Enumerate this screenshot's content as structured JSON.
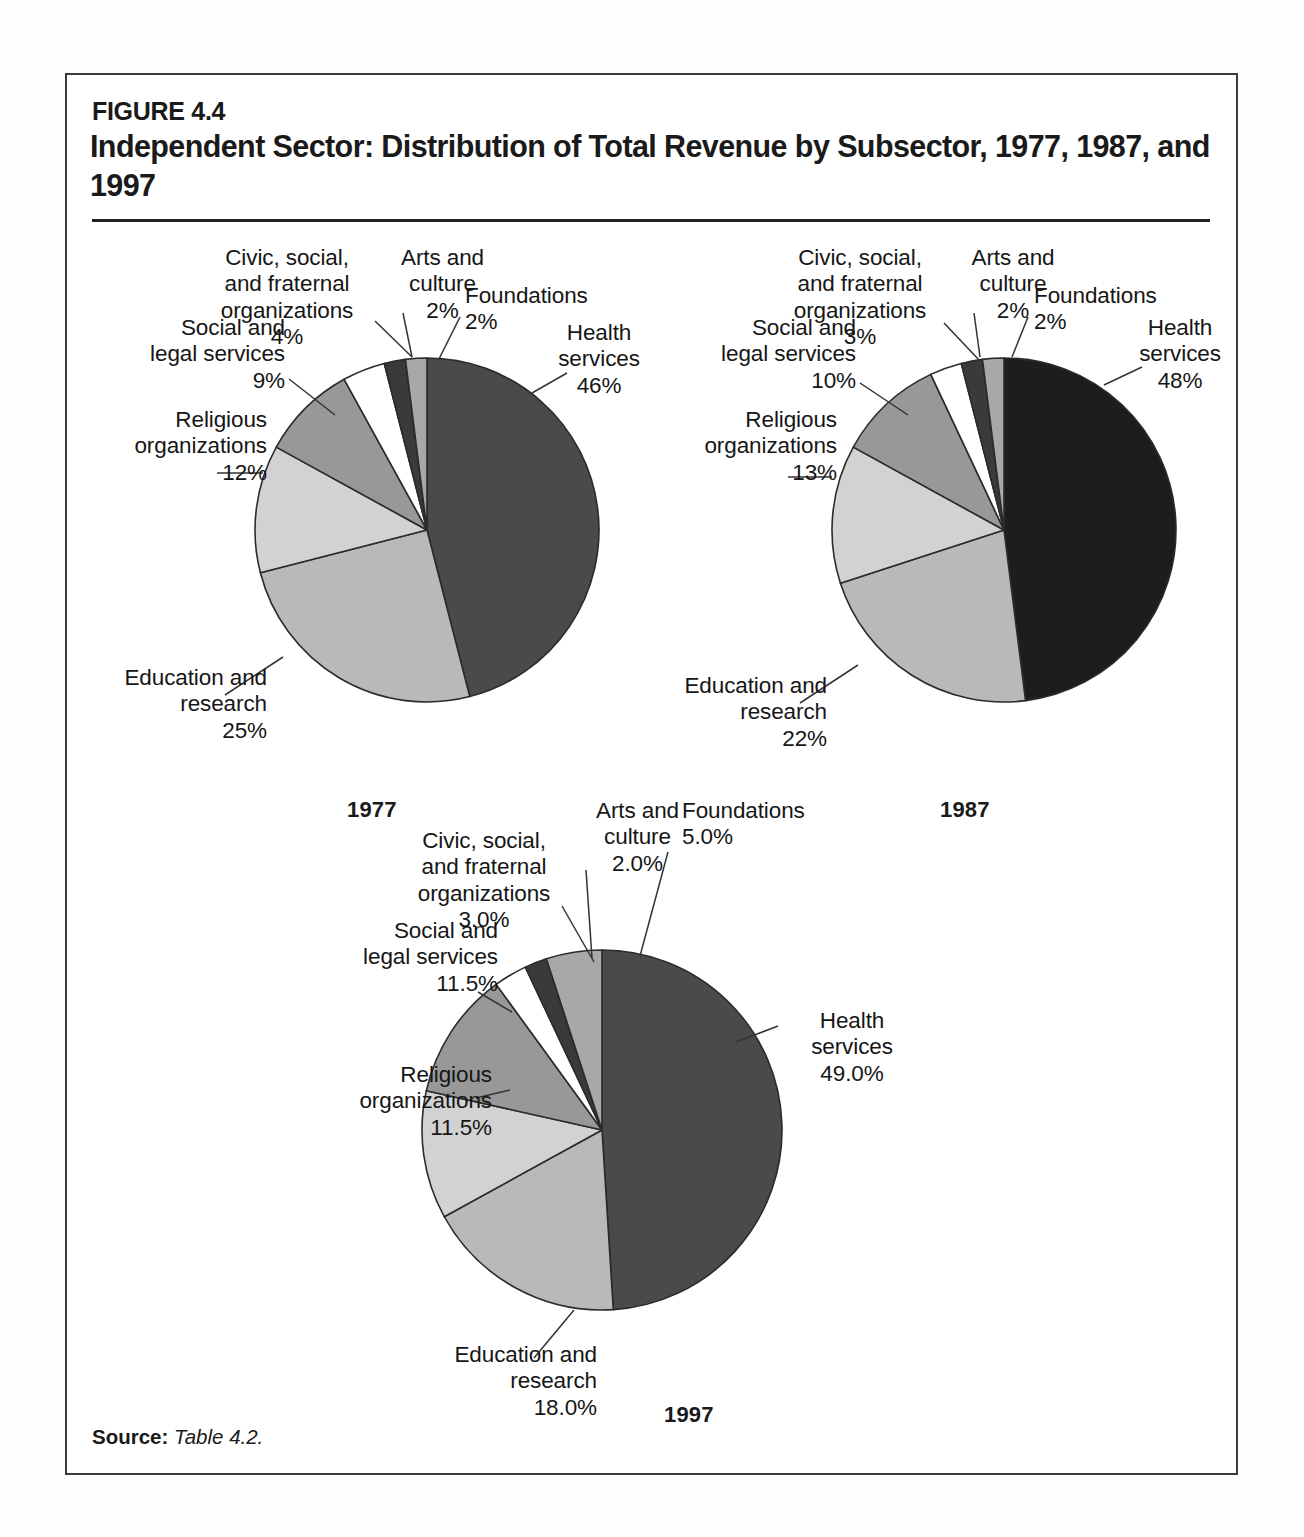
{
  "figure": {
    "number": "FIGURE 4.4",
    "title": "Independent Sector: Distribution of Total Revenue by Subsector,\n1977, 1987, and 1997",
    "source_label": "Source:",
    "source_value": "Table 4.2."
  },
  "chart_data": [
    {
      "type": "pie",
      "title": "1977",
      "categories": [
        "Health services",
        "Education and research",
        "Religious organizations",
        "Social and legal services",
        "Civic, social, and fraternal organizations",
        "Arts and culture",
        "Foundations"
      ],
      "values": [
        46,
        25,
        12,
        9,
        4,
        2,
        2
      ],
      "value_labels": [
        "46%",
        "25%",
        "12%",
        "9%",
        "4%",
        "2%",
        "2%"
      ],
      "colors": [
        "#4a4a4a",
        "#b9b9b9",
        "#d2d2d2",
        "#989898",
        "#ffffff",
        "#3a3a3a",
        "#a8a8a8"
      ],
      "start_angle": 0,
      "direction": "clockwise",
      "legend": "none"
    },
    {
      "type": "pie",
      "title": "1987",
      "categories": [
        "Health services",
        "Education and research",
        "Religious organizations",
        "Social and legal services",
        "Civic, social, and fraternal organizations",
        "Arts and culture",
        "Foundations"
      ],
      "values": [
        48,
        22,
        13,
        10,
        3,
        2,
        2
      ],
      "value_labels": [
        "48%",
        "22%",
        "13%",
        "10%",
        "3%",
        "2%",
        "2%"
      ],
      "colors": [
        "#1d1d1d",
        "#b9b9b9",
        "#d2d2d2",
        "#989898",
        "#ffffff",
        "#3a3a3a",
        "#a8a8a8"
      ],
      "start_angle": 0,
      "direction": "clockwise",
      "legend": "none"
    },
    {
      "type": "pie",
      "title": "1997",
      "categories": [
        "Health services",
        "Education and research",
        "Religious organizations",
        "Social and legal services",
        "Civic, social, and fraternal organizations",
        "Arts and culture",
        "Foundations"
      ],
      "values": [
        49.0,
        18.0,
        11.5,
        11.5,
        3.0,
        2.0,
        5.0
      ],
      "value_labels": [
        "49.0%",
        "18.0%",
        "11.5%",
        "11.5%",
        "3.0%",
        "2.0%",
        "5.0%"
      ],
      "colors": [
        "#4a4a4a",
        "#b9b9b9",
        "#d2d2d2",
        "#989898",
        "#ffffff",
        "#3a3a3a",
        "#a8a8a8"
      ],
      "start_angle": 0,
      "direction": "clockwise",
      "legend": "none"
    }
  ],
  "charts": {
    "c1977": {
      "year": "1977",
      "labels": {
        "civic": "Civic, social,\nand fraternal\norganizations\n4%",
        "arts": "Arts and\nculture\n2%",
        "foundations": "Foundations\n2%",
        "health": "Health\nservices\n46%",
        "social": "Social and\nlegal services\n9%",
        "religious": "Religious\norganizations\n12%",
        "education": "Education and\nresearch\n25%"
      }
    },
    "c1987": {
      "year": "1987",
      "labels": {
        "civic": "Civic, social,\nand fraternal\norganizations\n3%",
        "arts": "Arts and\nculture\n2%",
        "foundations": "Foundations\n2%",
        "health": "Health\nservices\n48%",
        "social": "Social and\nlegal services\n10%",
        "religious": "Religious\norganizations\n13%",
        "education": "Education and\nresearch\n22%"
      }
    },
    "c1997": {
      "year": "1997",
      "labels": {
        "civic": "Civic, social,\nand fraternal\norganizations\n3.0%",
        "arts": "Arts and\nculture\n2.0%",
        "foundations": "Foundations\n5.0%",
        "health": "Health\nservices\n49.0%",
        "social": "Social and\nlegal services\n11.5%",
        "religious": "Religious\norganizations\n11.5%",
        "education": "Education and\nresearch\n18.0%"
      }
    }
  }
}
